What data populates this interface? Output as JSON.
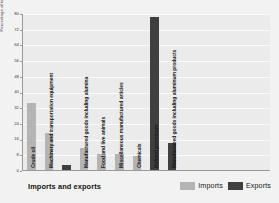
{
  "chart_data": {
    "type": "bar",
    "title": "",
    "xlabel": "Imports and exports",
    "ylabel": "Percentage of total",
    "ylim": [
      0,
      80
    ],
    "yticks": [
      0,
      8,
      16,
      24,
      32,
      40,
      48,
      56,
      64,
      72,
      80
    ],
    "grid": true,
    "legend_position": "bottom-right",
    "legend": [
      {
        "name": "Imports",
        "color": "#b4b4b4"
      },
      {
        "name": "Exports",
        "color": "#3f3f3f"
      }
    ],
    "categories": [
      "Crude oil",
      "Machinery and transportation equipment",
      "Manufactured goods including alumina",
      "Food and live animals",
      "Miscellaneous manufactured articles",
      "Chemicals",
      "Refined petroleum",
      "Manufactured goods including aluminum products"
    ],
    "bars": [
      {
        "label": "Crude oil",
        "series": "Imports",
        "value": 34,
        "color": "#b4b4b4"
      },
      {
        "label": "Machinery and transportation equipment",
        "series": "Imports",
        "value": 19,
        "color": "#b4b4b4"
      },
      {
        "label": "",
        "series": "Exports",
        "value": 2.5,
        "color": "#3f3f3f"
      },
      {
        "label": "Manufactured goods including alumina",
        "series": "Imports",
        "value": 11,
        "color": "#b4b4b4"
      },
      {
        "label": "Food and live animals",
        "series": "Imports",
        "value": 8,
        "color": "#b4b4b4"
      },
      {
        "label": "Miscellaneous manufactured articles",
        "series": "Imports",
        "value": 8,
        "color": "#b4b4b4"
      },
      {
        "label": "Chemicals",
        "series": "Imports",
        "value": 7,
        "color": "#b4b4b4"
      },
      {
        "label": "Refined petroleum",
        "series": "Exports",
        "value": 78,
        "color": "#3f3f3f"
      },
      {
        "label": "Manufactured goods including aluminum products",
        "series": "Exports",
        "value": 14,
        "color": "#3f3f3f"
      }
    ]
  }
}
